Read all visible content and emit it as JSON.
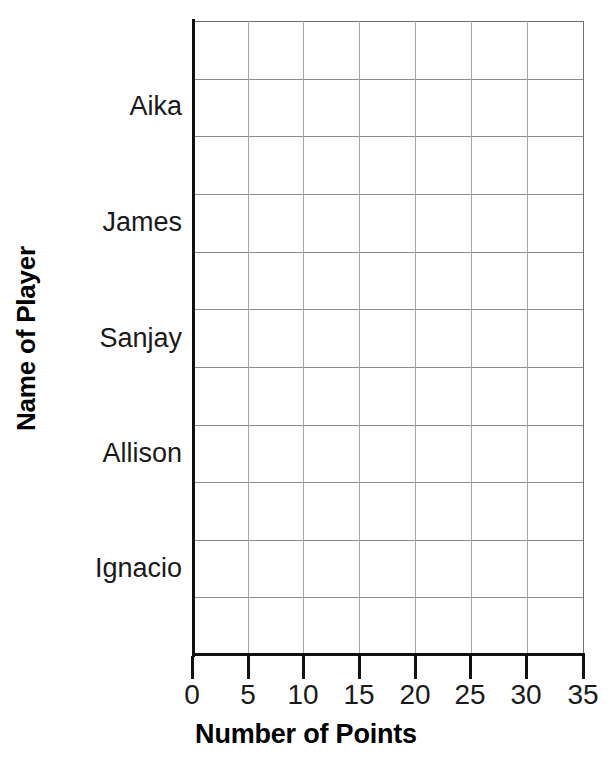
{
  "chart_data": {
    "type": "bar",
    "orientation": "horizontal",
    "title": "",
    "xlabel": "Number of Points",
    "ylabel": "Name of Player",
    "categories": [
      "Aika",
      "James",
      "Sanjay",
      "Allison",
      "Ignacio"
    ],
    "values": [
      null,
      null,
      null,
      null,
      null
    ],
    "note": "Empty grid template - no bars are drawn",
    "xlim": [
      0,
      35
    ],
    "xticks": [
      0,
      5,
      10,
      15,
      20,
      25,
      30,
      35
    ],
    "xtick_labels": [
      "0",
      "5",
      "10",
      "15",
      "20",
      "25",
      "30",
      "35"
    ],
    "grid": true,
    "grid_columns": 7,
    "grid_rows": 11,
    "legend": "none",
    "colors": {
      "background": "#ffffff",
      "text": "#1a1a1a",
      "axis": "#111111",
      "gridline": "#8d8d8d"
    }
  },
  "axes": {
    "y_title": "Name of Player",
    "x_title": "Number of Points",
    "category_labels": [
      {
        "label": "Aika",
        "y": 85
      },
      {
        "label": "James",
        "y": 201
      },
      {
        "label": "Sanjay",
        "y": 317
      },
      {
        "label": "Allison",
        "y": 432
      },
      {
        "label": "Ignacio",
        "y": 547
      }
    ],
    "x_ticks": [
      {
        "label": "0",
        "x": 192
      },
      {
        "label": "5",
        "x": 248
      },
      {
        "label": "10",
        "x": 303
      },
      {
        "label": "15",
        "x": 359
      },
      {
        "label": "20",
        "x": 415
      },
      {
        "label": "25",
        "x": 470
      },
      {
        "label": "30",
        "x": 526
      },
      {
        "label": "35",
        "x": 583
      }
    ]
  },
  "grid": {
    "h_lines": [
      0,
      57.6,
      115.3,
      172.9,
      230.5,
      288.2,
      345.8,
      403.5,
      461.1,
      518.7,
      576.4,
      633
    ],
    "v_lines": [
      0,
      55.9,
      111.4,
      167.3,
      223.2,
      278.7,
      334.6,
      390.9
    ]
  }
}
